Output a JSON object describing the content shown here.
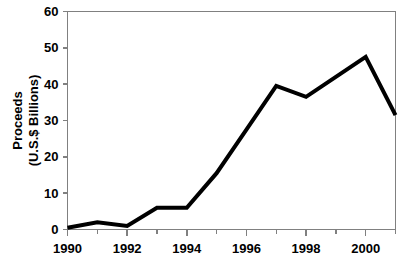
{
  "chart_data": {
    "type": "line",
    "title": "",
    "xlabel": "",
    "ylabel": "Proceeds (U.S.$ Billions)",
    "ylabel_lines": [
      "Proceeds",
      "(U.S.$ Billions)"
    ],
    "x": [
      1990,
      1991,
      1992,
      1993,
      1994,
      1995,
      1996,
      1997,
      1998,
      1999,
      2000,
      2001
    ],
    "values": [
      0.5,
      2.0,
      1.0,
      6.0,
      6.0,
      15.5,
      27.5,
      39.5,
      36.5,
      42.0,
      47.5,
      31.5
    ],
    "series": [
      {
        "name": "Proceeds",
        "values": [
          0.5,
          2.0,
          1.0,
          6.0,
          6.0,
          15.5,
          27.5,
          39.5,
          36.5,
          42.0,
          47.5,
          31.5
        ]
      }
    ],
    "xlim": [
      1990,
      2001
    ],
    "ylim": [
      0,
      60
    ],
    "ytick_labels": [
      "0",
      "10",
      "20",
      "30",
      "40",
      "50",
      "60"
    ],
    "ytick_values": [
      0,
      10,
      20,
      30,
      40,
      50,
      60
    ],
    "xtick_labels": [
      "1990",
      "1992",
      "1994",
      "1996",
      "1998",
      "2000"
    ],
    "xtick_values": [
      1990,
      1992,
      1994,
      1996,
      1998,
      2000
    ],
    "xminor_values": [
      1991,
      1993,
      1995,
      1997,
      1999,
      2001
    ],
    "grid": false,
    "legend": false,
    "legend_position": "none",
    "line_color": "#000000",
    "axis_color": "#808080",
    "background_color": "#ffffff",
    "line_width": 4
  }
}
